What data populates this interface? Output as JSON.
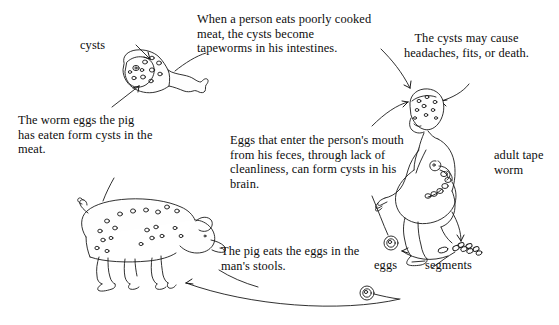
{
  "diagram": {
    "background_color": "#ffffff",
    "ink_color": "#111111",
    "captions": {
      "meat_eaten": "When a person eats poorly cooked meat, the cysts become tapeworms in his intestines.",
      "cysts_symptoms": "The cysts may cause headaches, fits, or death.",
      "worm_eggs_pig": "The worm eggs the pig has eaten form cysts in the meat.",
      "eggs_mouth": "Eggs that enter the person's mouth from his feces, through lack of cleanliness, can form cysts in his brain.",
      "pig_eats": "The pig eats the eggs in the man's stools."
    },
    "labels": {
      "cysts": "cysts",
      "adult_tape_worm": "adult tape worm",
      "eggs": "eggs",
      "segments": "segments"
    },
    "figures": {
      "meat": "ham-with-cysts",
      "pig": "pig-with-cysts",
      "person": "squatting-person-with-tapeworm",
      "egg_upper": "egg-circle",
      "egg_lower": "egg-circle",
      "segments_cluster": "tapeworm-segments"
    }
  }
}
